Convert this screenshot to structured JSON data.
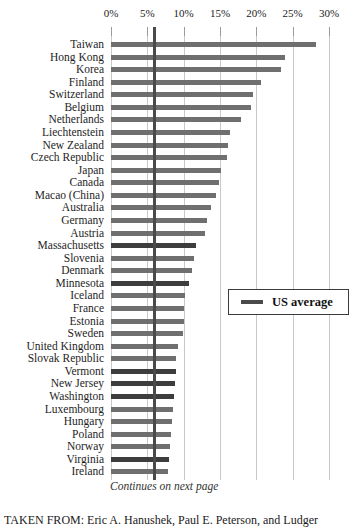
{
  "figure": {
    "continues_note": "Continues on next page",
    "caption": "TAKEN FROM: Eric A. Hanushek, Paul E. Peterson, and Ludger"
  },
  "colors": {
    "country_bar": "#6f6f6f",
    "state_bar": "#3d3d3d",
    "us_average_line": "#4a4a4a",
    "gridline": "#c9c9c9",
    "tick": "#9a9a9a",
    "background": "#ffffff"
  },
  "chart_data": {
    "type": "bar",
    "orientation": "horizontal",
    "title": "",
    "xlabel": "",
    "ylabel": "",
    "axis": {
      "position": "top",
      "min": 0,
      "max": 30,
      "tick_labels": [
        "0%",
        "5%",
        "10%",
        "15%",
        "20%",
        "25%",
        "30%"
      ],
      "tick_values": [
        0,
        5,
        10,
        15,
        20,
        25,
        30
      ],
      "grid": true
    },
    "legend": {
      "label": "US average",
      "position": "middle-right"
    },
    "us_average": 6.0,
    "categories": [
      "Taiwan",
      "Hong Kong",
      "Korea",
      "Finland",
      "Switzerland",
      "Belgium",
      "Netherlands",
      "Liechtenstein",
      "New Zealand",
      "Czech Republic",
      "Japan",
      "Canada",
      "Macao (China)",
      "Australia",
      "Germany",
      "Austria",
      "Massachusetts",
      "Slovenia",
      "Denmark",
      "Minnesota",
      "Iceland",
      "France",
      "Estonia",
      "Sweden",
      "United Kingdom",
      "Slovak Republic",
      "Vermont",
      "New Jersey",
      "Washington",
      "Luxembourg",
      "Hungary",
      "Poland",
      "Norway",
      "Virginia",
      "Ireland"
    ],
    "values": [
      28.2,
      24.0,
      23.4,
      20.7,
      19.5,
      19.2,
      17.9,
      16.4,
      16.1,
      15.9,
      15.2,
      14.8,
      14.5,
      13.7,
      13.2,
      13.0,
      11.7,
      11.4,
      11.2,
      10.8,
      10.2,
      10.1,
      10.0,
      9.9,
      9.2,
      9.0,
      8.9,
      8.8,
      8.7,
      8.5,
      8.4,
      8.2,
      8.1,
      8.0,
      7.8
    ],
    "highlighted_us_states": [
      "Massachusetts",
      "Minnesota",
      "Vermont",
      "New Jersey",
      "Washington",
      "Virginia"
    ]
  }
}
